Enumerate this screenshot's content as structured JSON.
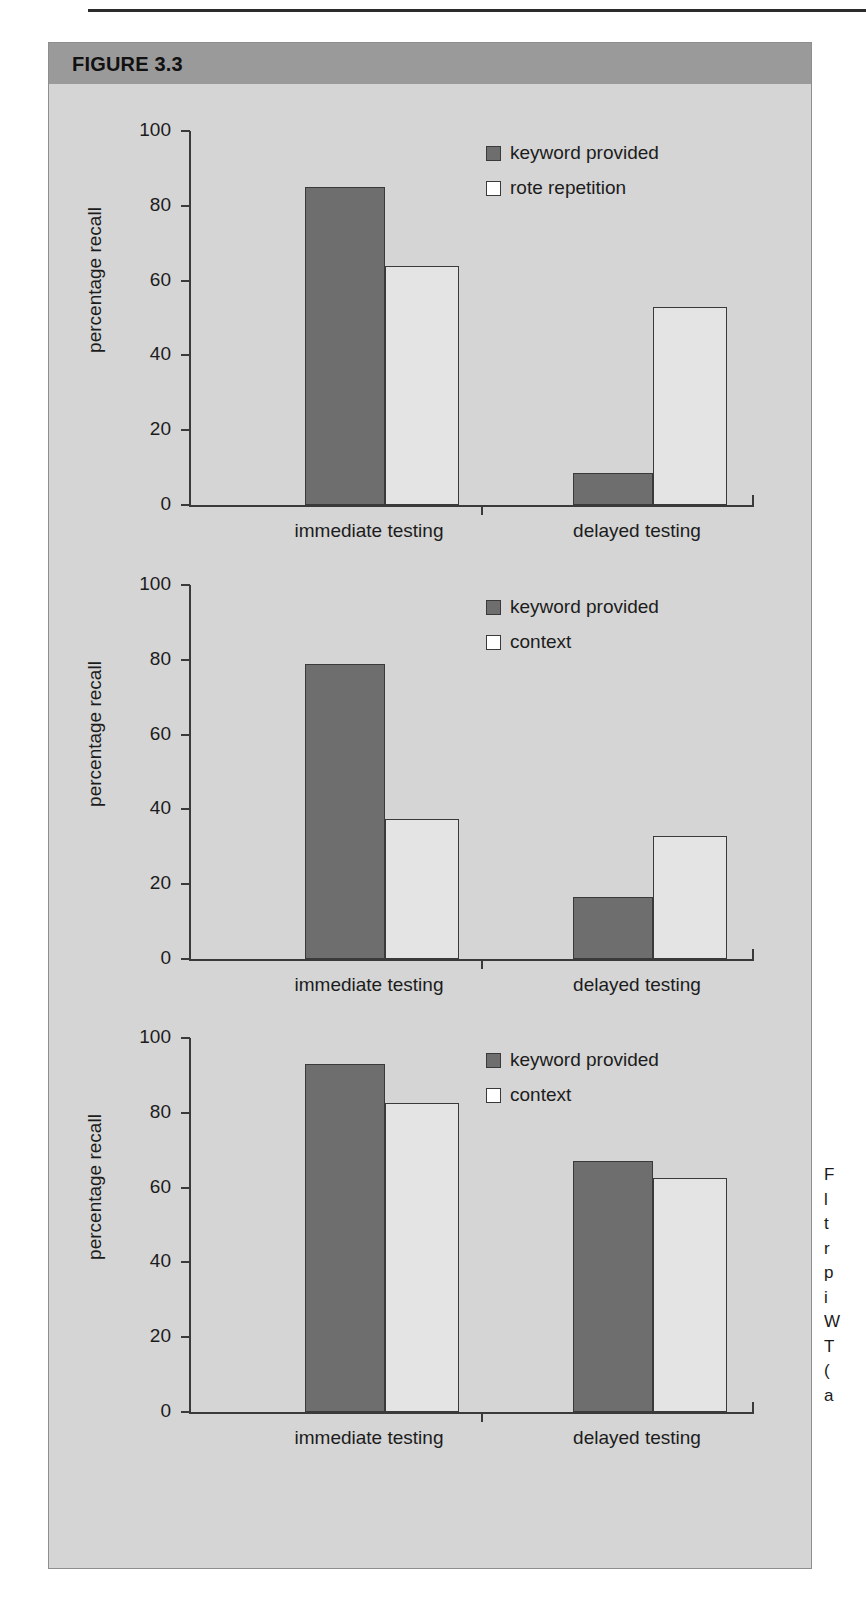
{
  "figure": {
    "header_label": "FIGURE 3.3",
    "accent_header_color": "#9a9a9a",
    "panel_bg_color": "#d5d5d5",
    "bar_fill_color": "#6e6e6e",
    "bar_open_color": "#e4e4e4",
    "axis_color": "#3a3a3a"
  },
  "caption": {
    "lines": [
      "F",
      "l",
      "t",
      "r",
      "p",
      "i",
      "W",
      "T",
      "(",
      "a"
    ]
  },
  "chart_data": [
    {
      "type": "bar",
      "title": "",
      "xlabel": "",
      "ylabel": "percentage recall",
      "ylim": [
        0,
        100
      ],
      "yticks": [
        0,
        20,
        40,
        60,
        80,
        100
      ],
      "ytick_labels": [
        "0",
        "20",
        "40",
        "60",
        "80",
        "100"
      ],
      "grid": false,
      "legend_position": "top-right",
      "categories": [
        "immediate testing",
        "delayed testing"
      ],
      "series": [
        {
          "name": "keyword provided",
          "style": "filled",
          "values": [
            85,
            8.5
          ]
        },
        {
          "name": "rote repetition",
          "style": "open",
          "values": [
            64,
            53
          ]
        }
      ]
    },
    {
      "type": "bar",
      "title": "",
      "xlabel": "",
      "ylabel": "percentage recall",
      "ylim": [
        0,
        100
      ],
      "yticks": [
        0,
        20,
        40,
        60,
        80,
        100
      ],
      "ytick_labels": [
        "0",
        "20",
        "40",
        "60",
        "80",
        "100"
      ],
      "grid": false,
      "legend_position": "top-right",
      "categories": [
        "immediate testing",
        "delayed testing"
      ],
      "series": [
        {
          "name": "keyword provided",
          "style": "filled",
          "values": [
            79,
            16.5
          ]
        },
        {
          "name": "context",
          "style": "open",
          "values": [
            37.5,
            33
          ]
        }
      ]
    },
    {
      "type": "bar",
      "title": "",
      "xlabel": "",
      "ylabel": "percentage recall",
      "ylim": [
        0,
        100
      ],
      "yticks": [
        0,
        20,
        40,
        60,
        80,
        100
      ],
      "ytick_labels": [
        "0",
        "20",
        "40",
        "60",
        "80",
        "100"
      ],
      "grid": false,
      "legend_position": "top-right",
      "categories": [
        "immediate testing",
        "delayed testing"
      ],
      "series": [
        {
          "name": "keyword provided",
          "style": "filled",
          "values": [
            93,
            67
          ]
        },
        {
          "name": "context",
          "style": "open",
          "values": [
            82.5,
            62.5
          ]
        }
      ]
    }
  ]
}
